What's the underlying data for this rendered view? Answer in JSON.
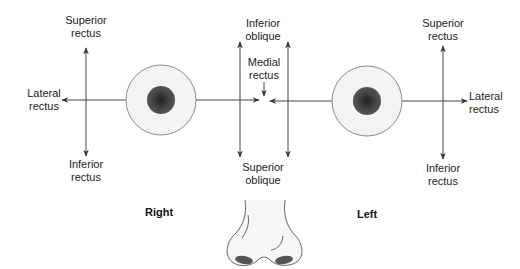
{
  "diagram": {
    "colors": {
      "line": "#3a3a3a",
      "sclera": "#f3f3f3",
      "sclera_border": "#8a8a8a",
      "iris": "#4a4a4a",
      "pupil": "#262626"
    },
    "right_eye": {
      "superior_rectus": {
        "line1": "Superior",
        "line2": "rectus"
      },
      "inferior_rectus": {
        "line1": "Inferior",
        "line2": "rectus"
      },
      "lateral_rectus": {
        "line1": "Lateral",
        "line2": "rectus"
      },
      "side_label": "Right"
    },
    "center": {
      "inferior_oblique": {
        "line1": "Inferior",
        "line2": "oblique"
      },
      "medial_rectus": {
        "line1": "Medial",
        "line2": "rectus"
      },
      "superior_oblique": {
        "line1": "Superior",
        "line2": "oblique"
      }
    },
    "left_eye": {
      "superior_rectus": {
        "line1": "Superior",
        "line2": "rectus"
      },
      "inferior_rectus": {
        "line1": "Inferior",
        "line2": "rectus"
      },
      "lateral_rectus": {
        "line1": "Lateral",
        "line2": "rectus"
      },
      "side_label": "Left"
    }
  }
}
